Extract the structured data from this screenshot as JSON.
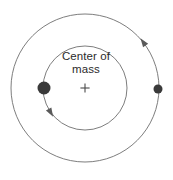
{
  "figure": {
    "background_color": "#ffffff",
    "width": 173,
    "height": 180
  },
  "labels": {
    "center_of_mass_line1": "Center of",
    "center_of_mass_line2": "mass",
    "center_marker": "+"
  },
  "colors": {
    "orbit_stroke": "#6e6e6e",
    "arrow_fill": "#5a5a5a",
    "body_fill": "#3a3a3a",
    "text": "#2b2b2b",
    "cross_stroke": "#4a4a4a"
  },
  "chart_data": {
    "type": "diagram",
    "center_of_mass": {
      "x": 85,
      "y": 88,
      "marker": "+"
    },
    "orbits": [
      {
        "name": "inner-orbit",
        "belongs_to": "large-body",
        "center_x": 85,
        "center_y": 88,
        "radius": 42,
        "direction": "counterclockwise",
        "arrow_angle_deg": 150
      },
      {
        "name": "outer-orbit",
        "belongs_to": "small-body",
        "center_x": 85,
        "center_y": 88,
        "radius": 74,
        "direction": "counterclockwise",
        "arrow_angle_deg": 325
      }
    ],
    "bodies": [
      {
        "name": "large-body",
        "x": 44,
        "y": 88,
        "radius": 6.5,
        "orbit": "inner-orbit",
        "relative_mass": "larger"
      },
      {
        "name": "small-body",
        "x": 158,
        "y": 89,
        "radius": 4.5,
        "orbit": "outer-orbit",
        "relative_mass": "smaller"
      }
    ],
    "annotations": [
      {
        "text": "Center of mass",
        "x": 86,
        "y": 62
      }
    ]
  }
}
